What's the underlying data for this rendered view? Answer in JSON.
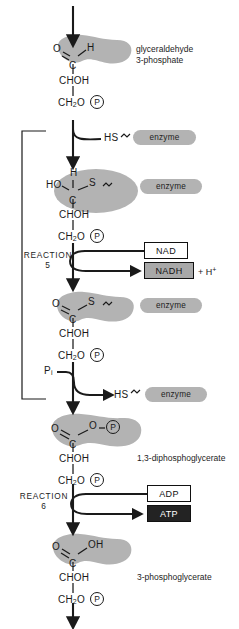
{
  "diagram": {
    "colors": {
      "highlight_blob": "#b3b3b3",
      "enzyme_pill": "#b3b3b3",
      "nad_box": "#ffffff",
      "nadh_box": "#a8a8a8",
      "adp_box": "#ffffff",
      "atp_box": "#232323",
      "stroke": "#1a1a1a"
    }
  },
  "reactions": [
    {
      "id": "reaction-5",
      "line1": "REACTION",
      "line2": "5"
    },
    {
      "id": "reaction-6",
      "line1": "REACTION",
      "line2": "6"
    }
  ],
  "compounds": [
    {
      "id": "glyceraldehyde-3-phosphate",
      "name_line1": "glyceraldehyde",
      "name_line2": "3-phosphate",
      "atoms": {
        "left": "O",
        "right": "H",
        "center": "C",
        "chain1": "CHOH",
        "chain2": "CH",
        "chain2_sub": "2",
        "chain2_tail": "O",
        "phosphate": "P"
      }
    },
    {
      "id": "thiohemiacetal-intermediate",
      "name_line1": "",
      "name_line2": "",
      "atoms": {
        "left": "HO",
        "top": "H",
        "right": "S",
        "center": "C",
        "chain1": "CHOH",
        "chain2": "CH",
        "chain2_sub": "2",
        "chain2_tail": "O",
        "phosphate": "P"
      }
    },
    {
      "id": "thioester-intermediate",
      "name_line1": "",
      "name_line2": "",
      "atoms": {
        "left": "O",
        "right": "S",
        "center": "C",
        "chain1": "CHOH",
        "chain2": "CH",
        "chain2_sub": "2",
        "chain2_tail": "O",
        "phosphate": "P"
      }
    },
    {
      "id": "1-3-diphosphoglycerate",
      "name_line1": "1,3-diphosphoglycerate",
      "name_line2": "",
      "atoms": {
        "left": "O",
        "right": "O",
        "center": "C",
        "chain1": "CHOH",
        "chain2": "CH",
        "chain2_sub": "2",
        "chain2_tail": "O",
        "phosphate": "P",
        "phosphate_top": "P"
      }
    },
    {
      "id": "3-phosphoglycerate",
      "name_line1": "3-phosphoglycerate",
      "name_line2": "",
      "atoms": {
        "left": "O",
        "right": "OH",
        "center": "C",
        "chain1": "CHOH",
        "chain2": "CH",
        "chain2_sub": "2",
        "chain2_tail": "O",
        "phosphate": "P"
      }
    }
  ],
  "enzymes": [
    {
      "id": "enzyme-binding",
      "thiol": "HS",
      "tilde": "~",
      "label": "enzyme"
    },
    {
      "id": "enzyme-bound-1",
      "tilde": "~",
      "label": "enzyme"
    },
    {
      "id": "enzyme-bound-2",
      "tilde": "~",
      "label": "enzyme"
    },
    {
      "id": "enzyme-release",
      "thiol": "HS",
      "tilde": "~",
      "label": "enzyme"
    }
  ],
  "cofactors": {
    "nad": "NAD",
    "nadh": "NADH",
    "proton": "+ H",
    "proton_sup": "+",
    "adp": "ADP",
    "atp": "ATP"
  },
  "inputs": {
    "phosphate_inorganic": "P",
    "phosphate_inorganic_sub": "i"
  }
}
